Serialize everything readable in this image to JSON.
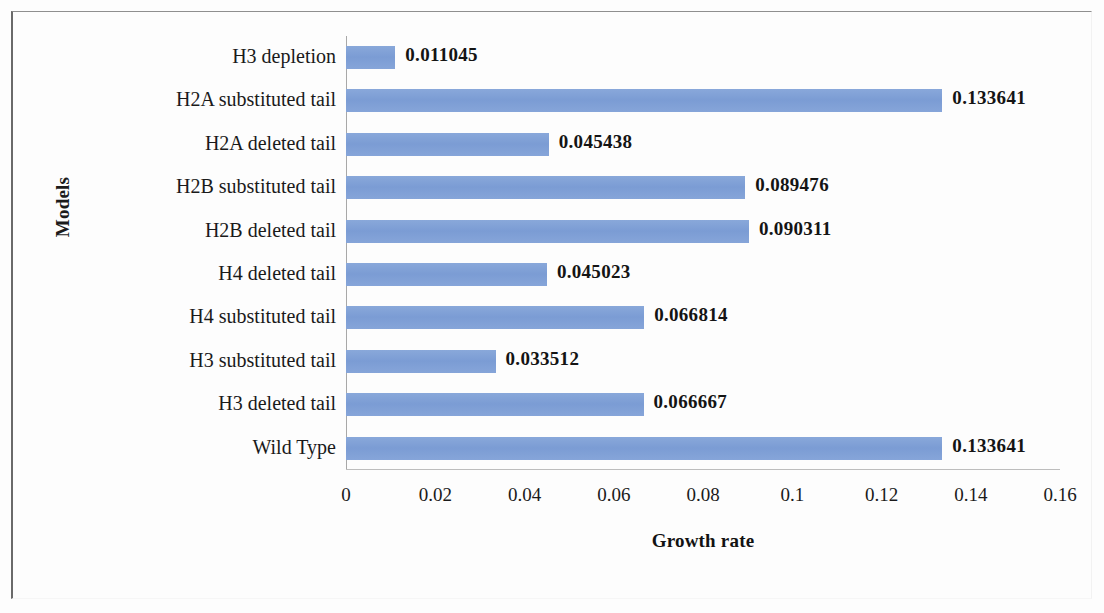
{
  "chart_data": {
    "type": "bar",
    "orientation": "horizontal",
    "title": "",
    "xlabel": "Growth rate",
    "ylabel": "Models",
    "xlim": [
      0,
      0.16
    ],
    "grid": false,
    "legend": null,
    "bar_color": "#7e9fd6",
    "xticks": [
      "0",
      "0.02",
      "0.04",
      "0.06",
      "0.08",
      "0.1",
      "0.12",
      "0.14",
      "0.16"
    ],
    "xtick_values": [
      0,
      0.02,
      0.04,
      0.06,
      0.08,
      0.1,
      0.12,
      0.14,
      0.16
    ],
    "categories": [
      "H3 depletion",
      "H2A substituted tail",
      "H2A deleted tail",
      "H2B substituted tail",
      "H2B deleted tail",
      "H4 deleted tail",
      "H4 substituted tail",
      "H3 substituted tail",
      "H3 deleted tail",
      "Wild Type"
    ],
    "values": [
      0.011045,
      0.133641,
      0.045438,
      0.089476,
      0.090311,
      0.045023,
      0.066814,
      0.033512,
      0.066667,
      0.133641
    ],
    "value_labels": [
      "0.011045",
      "0.133641",
      "0.045438",
      "0.089476",
      "0.090311",
      "0.045023",
      "0.066814",
      "0.033512",
      "0.066667",
      "0.133641"
    ]
  }
}
